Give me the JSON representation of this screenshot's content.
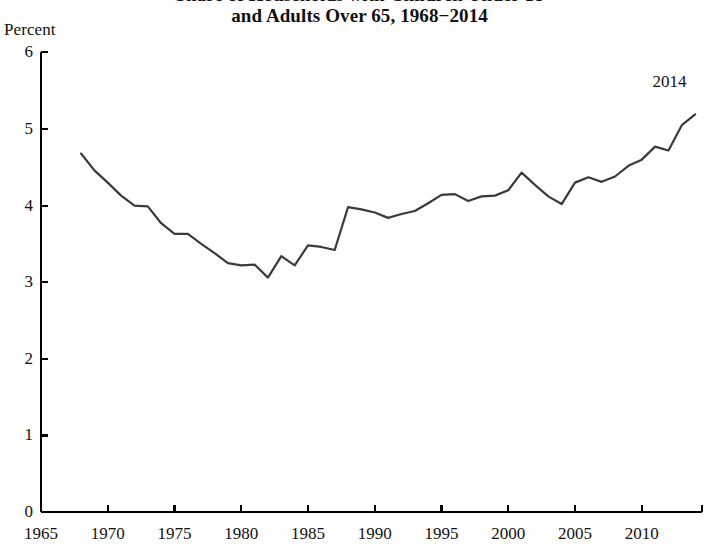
{
  "chart_data": {
    "type": "line",
    "title_lines": [
      "Share of Households with Children Under 18",
      "and Adults Over 65, 1968−2014"
    ],
    "xlabel": "",
    "ylabel": "Percent",
    "ylim": [
      0,
      6
    ],
    "xlim": [
      1965,
      2014.5
    ],
    "ytick_labels": [
      "0",
      "1",
      "2",
      "3",
      "4",
      "5",
      "6"
    ],
    "ytick_values": [
      0,
      1,
      2,
      3,
      4,
      5,
      6
    ],
    "xtick_labels": [
      "1965",
      "1970",
      "1975",
      "1980",
      "1985",
      "1990",
      "1995",
      "2000",
      "2005",
      "2010"
    ],
    "xtick_values": [
      1965,
      1970,
      1975,
      1980,
      1985,
      1990,
      1995,
      2000,
      2005,
      2010
    ],
    "grid": false,
    "legend": null,
    "annotations": [
      {
        "text": "2014",
        "x": 2012.6,
        "y": 5.62
      }
    ],
    "line_color": "#3b3b3b",
    "axis_color": "#000000",
    "series": [
      {
        "name": "Share of households with children under 18 and adults over 65",
        "x": [
          1968,
          1969,
          1970,
          1971,
          1972,
          1973,
          1974,
          1975,
          1976,
          1977,
          1978,
          1979,
          1980,
          1981,
          1982,
          1983,
          1984,
          1985,
          1986,
          1987,
          1988,
          1989,
          1990,
          1991,
          1992,
          1993,
          1994,
          1995,
          1996,
          1997,
          1998,
          1999,
          2000,
          2001,
          2002,
          2003,
          2004,
          2005,
          2006,
          2007,
          2008,
          2009,
          2010,
          2011,
          2012,
          2013,
          2014
        ],
        "values": [
          4.68,
          4.46,
          4.3,
          4.13,
          4.0,
          3.99,
          3.77,
          3.63,
          3.63,
          3.5,
          3.38,
          3.25,
          3.22,
          3.23,
          3.06,
          3.34,
          3.22,
          3.48,
          3.46,
          3.42,
          3.98,
          3.95,
          3.91,
          3.84,
          3.89,
          3.93,
          4.03,
          4.14,
          4.15,
          4.06,
          4.12,
          4.13,
          4.2,
          4.43,
          4.27,
          4.12,
          4.02,
          4.3,
          4.37,
          4.31,
          4.38,
          4.52,
          4.6,
          4.77,
          4.72,
          5.05,
          5.19
        ]
      }
    ]
  },
  "annotation_2014": "2014"
}
